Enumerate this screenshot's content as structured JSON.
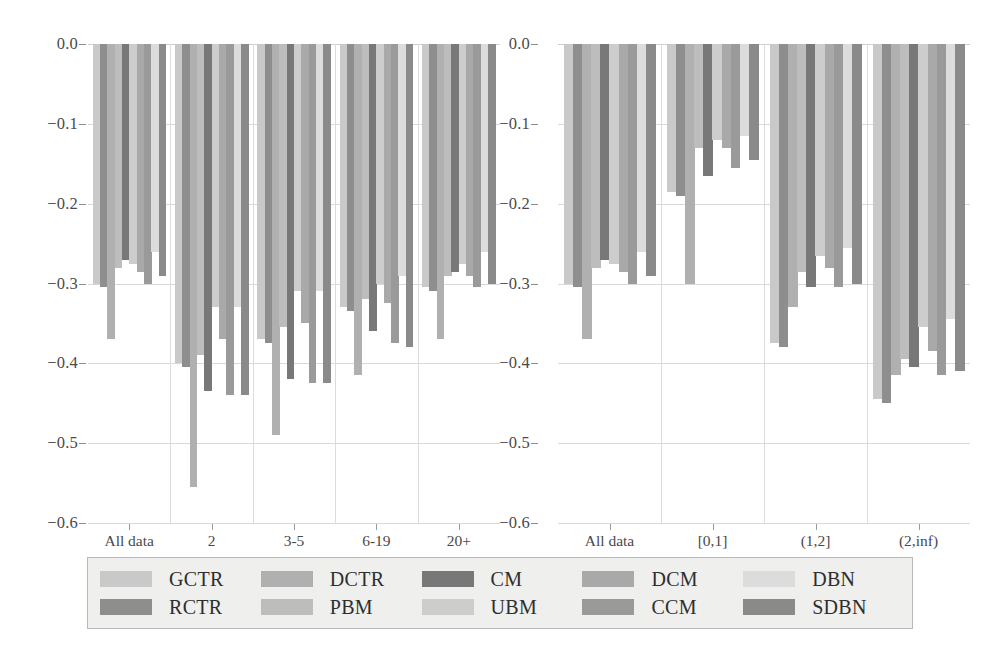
{
  "figure": {
    "background": "#ffffff",
    "panels": [
      "left",
      "right"
    ]
  },
  "axis": {
    "ytick_labels": [
      "0.0",
      "−0.1",
      "−0.2",
      "−0.3",
      "−0.4",
      "−0.5",
      "−0.6"
    ],
    "ytick_values": [
      0.0,
      -0.1,
      -0.2,
      -0.3,
      -0.4,
      -0.5,
      -0.6
    ],
    "ylim": [
      -0.6,
      0.0
    ],
    "grid": true
  },
  "legend": {
    "position": "bottom",
    "background": "#efefed",
    "border": "#b8b8b6",
    "entries": [
      {
        "label": "GCTR",
        "color": "#c9c9c9"
      },
      {
        "label": "RCTR",
        "color": "#8e8e8e"
      },
      {
        "label": "DCTR",
        "color": "#b0b0b0"
      },
      {
        "label": "PBM",
        "color": "#bdbdbd"
      },
      {
        "label": "CM",
        "color": "#787878"
      },
      {
        "label": "UBM",
        "color": "#cdcdcd"
      },
      {
        "label": "DCM",
        "color": "#a9a9a9"
      },
      {
        "label": "CCM",
        "color": "#9a9a9a"
      },
      {
        "label": "DBN",
        "color": "#dcdcdc"
      },
      {
        "label": "SDBN",
        "color": "#8a8a8a"
      }
    ]
  },
  "chart_data": [
    {
      "type": "bar",
      "panel": "left",
      "title": "",
      "xlabel": "",
      "ylabel": "",
      "ylim": [
        -0.6,
        0.0
      ],
      "grid": true,
      "categories": [
        "All data",
        "2",
        "3-5",
        "6-19",
        "20+"
      ],
      "series": [
        {
          "name": "GCTR",
          "color": "#c9c9c9",
          "values": [
            -0.3,
            -0.4,
            -0.37,
            -0.33,
            -0.305
          ]
        },
        {
          "name": "RCTR",
          "color": "#8e8e8e",
          "values": [
            -0.305,
            -0.405,
            -0.375,
            -0.335,
            -0.31
          ]
        },
        {
          "name": "DCTR",
          "color": "#b0b0b0",
          "values": [
            -0.37,
            -0.555,
            -0.49,
            -0.415,
            -0.37
          ]
        },
        {
          "name": "PBM",
          "color": "#bdbdbd",
          "values": [
            -0.28,
            -0.39,
            -0.355,
            -0.32,
            -0.29
          ]
        },
        {
          "name": "CM",
          "color": "#787878",
          "values": [
            -0.27,
            -0.435,
            -0.42,
            -0.36,
            -0.285
          ]
        },
        {
          "name": "UBM",
          "color": "#cdcdcd",
          "values": [
            -0.275,
            -0.33,
            -0.31,
            -0.3,
            -0.275
          ]
        },
        {
          "name": "DCM",
          "color": "#a9a9a9",
          "values": [
            -0.285,
            -0.37,
            -0.35,
            -0.325,
            -0.29
          ]
        },
        {
          "name": "CCM",
          "color": "#9a9a9a",
          "values": [
            -0.3,
            -0.44,
            -0.425,
            -0.375,
            -0.305
          ]
        },
        {
          "name": "DBN",
          "color": "#dcdcdc",
          "values": [
            -0.26,
            -0.33,
            -0.31,
            -0.29,
            -0.26
          ]
        },
        {
          "name": "SDBN",
          "color": "#8a8a8a",
          "values": [
            -0.29,
            -0.44,
            -0.425,
            -0.38,
            -0.3
          ]
        }
      ]
    },
    {
      "type": "bar",
      "panel": "right",
      "title": "",
      "xlabel": "",
      "ylabel": "",
      "ylim": [
        -0.6,
        0.0
      ],
      "grid": true,
      "categories": [
        "All data",
        "[0,1]",
        "(1,2]",
        "(2,inf)"
      ],
      "series": [
        {
          "name": "GCTR",
          "color": "#c9c9c9",
          "values": [
            -0.3,
            -0.185,
            -0.375,
            -0.445
          ]
        },
        {
          "name": "RCTR",
          "color": "#8e8e8e",
          "values": [
            -0.305,
            -0.19,
            -0.38,
            -0.45
          ]
        },
        {
          "name": "DCTR",
          "color": "#b0b0b0",
          "values": [
            -0.37,
            -0.3,
            -0.33,
            -0.415
          ]
        },
        {
          "name": "PBM",
          "color": "#bdbdbd",
          "values": [
            -0.28,
            -0.13,
            -0.285,
            -0.395
          ]
        },
        {
          "name": "CM",
          "color": "#787878",
          "values": [
            -0.27,
            -0.165,
            -0.305,
            -0.405
          ]
        },
        {
          "name": "UBM",
          "color": "#cdcdcd",
          "values": [
            -0.275,
            -0.12,
            -0.265,
            -0.355
          ]
        },
        {
          "name": "DCM",
          "color": "#a9a9a9",
          "values": [
            -0.285,
            -0.13,
            -0.28,
            -0.385
          ]
        },
        {
          "name": "CCM",
          "color": "#9a9a9a",
          "values": [
            -0.3,
            -0.155,
            -0.305,
            -0.415
          ]
        },
        {
          "name": "DBN",
          "color": "#dcdcdc",
          "values": [
            -0.26,
            -0.115,
            -0.255,
            -0.345
          ]
        },
        {
          "name": "SDBN",
          "color": "#8a8a8a",
          "values": [
            -0.29,
            -0.145,
            -0.3,
            -0.41
          ]
        }
      ]
    }
  ]
}
